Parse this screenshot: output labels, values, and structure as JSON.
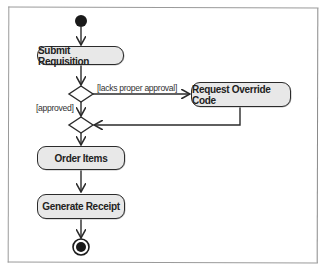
{
  "diagram": {
    "type": "UML activity diagram",
    "initial_node": {
      "label": "start"
    },
    "final_node": {
      "label": "end"
    },
    "actions": [
      {
        "id": "submit",
        "label": "Submit Requisition"
      },
      {
        "id": "override",
        "label": "Request Override Code"
      },
      {
        "id": "order",
        "label": "Order Items"
      },
      {
        "id": "receipt",
        "label": "Generate Receipt"
      }
    ],
    "guards": {
      "lacks_approval": "[lacks proper approval]",
      "approved": "[approved]"
    },
    "flows": [
      {
        "from": "start",
        "to": "submit"
      },
      {
        "from": "submit",
        "to": "decision"
      },
      {
        "from": "decision",
        "to": "override",
        "guard": "[lacks proper approval]"
      },
      {
        "from": "decision",
        "to": "merge",
        "guard": "[approved]"
      },
      {
        "from": "override",
        "to": "merge"
      },
      {
        "from": "merge",
        "to": "order"
      },
      {
        "from": "order",
        "to": "receipt"
      },
      {
        "from": "receipt",
        "to": "end"
      }
    ],
    "colors": {
      "action_fill": "#e8e8e8",
      "stroke": "#2b2b2b",
      "frame": "#9a9a9a"
    }
  }
}
